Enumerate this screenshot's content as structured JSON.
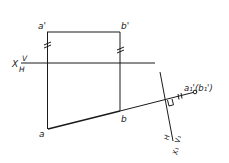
{
  "diagram": {
    "type": "orthographic-projection-auxiliary-view",
    "colors": {
      "line": "#1a1a1a",
      "background": "#ffffff"
    },
    "points": {
      "a_prime": {
        "label": "a'",
        "x": 47,
        "y": 32
      },
      "b_prime": {
        "label": "b'",
        "x": 120,
        "y": 32
      },
      "a": {
        "label": "a",
        "x": 48,
        "y": 129
      },
      "b": {
        "label": "b",
        "x": 120,
        "y": 111
      },
      "a1_b1": {
        "label": "a₁'(b₁')",
        "x": 195,
        "y": 92
      }
    },
    "axis_x": {
      "label_x": "X",
      "label_upper": "V",
      "label_lower": "H",
      "y": 63,
      "x_start": 21,
      "x_end": 155
    },
    "axis_x1": {
      "label_x": "X₁",
      "label_upper": "V₁",
      "label_lower": "H",
      "start": {
        "x": 160,
        "y": 72
      },
      "end": {
        "x": 173,
        "y": 141
      }
    },
    "marks": {
      "equal_marks": "//",
      "perpendicular": "right-angle"
    }
  }
}
